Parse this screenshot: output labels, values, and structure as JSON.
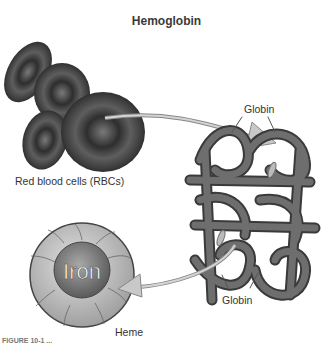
{
  "figure": {
    "title": "Hemoglobin",
    "labels": {
      "rbc": "Red blood cells (RBCs)",
      "globin_top": "Globin",
      "globin_bottom": "Globin",
      "iron": "Iron",
      "heme": "Heme"
    },
    "caption": "FIGURE 10-1 ...",
    "colors": {
      "cell_dark": "#2a2a2a",
      "cell_mid": "#6a6a6a",
      "globin_chain": "#5a5a5a",
      "heme_disc": "#bdbdbd",
      "iron_core": "#7a7a7a",
      "arrow_fill": "#c8c8c8"
    }
  }
}
